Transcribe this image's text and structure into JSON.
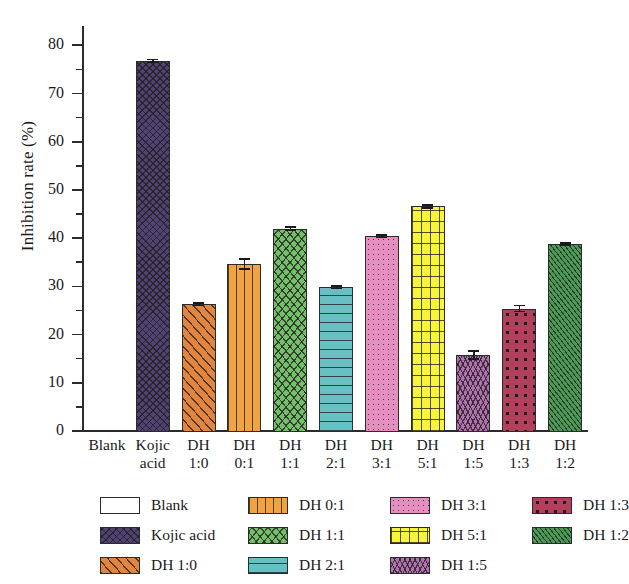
{
  "chart_data": {
    "type": "bar",
    "title": "",
    "xlabel": "",
    "ylabel": "Inhibition rate (%)",
    "ylim": [
      0,
      84
    ],
    "yticks": [
      0,
      10,
      20,
      30,
      40,
      50,
      60,
      70,
      80
    ],
    "yticklabels": [
      "0",
      "10",
      "20",
      "30",
      "40",
      "50",
      "60",
      "70",
      "80"
    ],
    "minor_tick_step": 5,
    "grid": false,
    "legend_position": "below-axes",
    "categories": [
      "Blank",
      "Kojic\nacid",
      "DH\n1:0",
      "DH\n0:1",
      "DH\n1:1",
      "DH\n2:1",
      "DH\n3:1",
      "DH\n5:1",
      "DH\n1:5",
      "DH\n1:3",
      "DH\n1:2"
    ],
    "series": [
      {
        "name": "Inhibition rate (%)",
        "values": [
          0,
          77.0,
          26.5,
          34.8,
          42.2,
          30.0,
          40.6,
          46.8,
          16.0,
          25.6,
          39.0
        ],
        "errors": [
          0,
          0.4,
          0.4,
          1.2,
          0.5,
          0.4,
          0.4,
          0.5,
          1.0,
          0.8,
          0.4
        ]
      }
    ],
    "bar_styles": [
      {
        "label": "Blank",
        "color": "#ffffff",
        "pattern": "solid"
      },
      {
        "label": "Kojic acid",
        "color": "#4e4372",
        "pattern": "crosshatch"
      },
      {
        "label": "DH 1:0",
        "color": "#e2853f",
        "pattern": "diagonal"
      },
      {
        "label": "DH 0:1",
        "color": "#f0a340",
        "pattern": "vertical"
      },
      {
        "label": "DH 1:1",
        "color": "#74bf6a",
        "pattern": "crosshatch-diag"
      },
      {
        "label": "DH 2:1",
        "color": "#69c0c4",
        "pattern": "horizontal"
      },
      {
        "label": "DH 3:1",
        "color": "#e58fc0",
        "pattern": "dots"
      },
      {
        "label": "DH 5:1",
        "color": "#f7f43c",
        "pattern": "grid"
      },
      {
        "label": "DH 1:5",
        "color": "#b272b2",
        "pattern": "wave"
      },
      {
        "label": "DH 1:3",
        "color": "#b0405c",
        "pattern": "stars"
      },
      {
        "label": "DH 1:2",
        "color": "#4a9a55",
        "pattern": "fine-diag"
      }
    ]
  },
  "legend": {
    "columns": [
      [
        {
          "label": "Blank",
          "swatch": "swatch-blank"
        },
        {
          "label": "Kojic acid",
          "swatch": "swatch-kojic-acid"
        },
        {
          "label": "DH 1:0",
          "swatch": "swatch-dh-1-0"
        }
      ],
      [
        {
          "label": "DH 0:1",
          "swatch": "swatch-dh-0-1"
        },
        {
          "label": "DH 1:1",
          "swatch": "swatch-dh-1-1"
        },
        {
          "label": "DH 2:1",
          "swatch": "swatch-dh-2-1"
        }
      ],
      [
        {
          "label": "DH 3:1",
          "swatch": "swatch-dh-3-1"
        },
        {
          "label": "DH 5:1",
          "swatch": "swatch-dh-5-1"
        },
        {
          "label": "DH 1:5",
          "swatch": "swatch-dh-1-5"
        }
      ],
      [
        {
          "label": "DH 1:3",
          "swatch": "swatch-dh-1-3"
        },
        {
          "label": "DH 1:2",
          "swatch": "swatch-dh-1-2"
        }
      ]
    ]
  },
  "colors": {
    "axis": "#2b2b2b",
    "text": "#1a1a1a",
    "background": "#ffffff"
  }
}
